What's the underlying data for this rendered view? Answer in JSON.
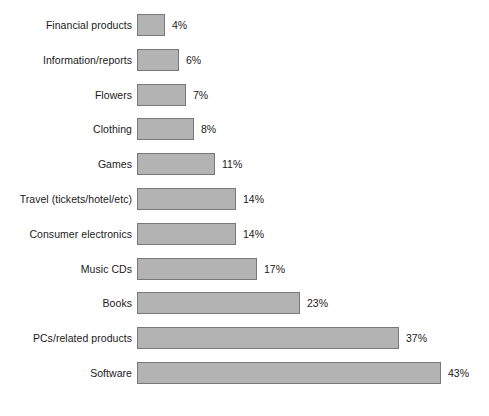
{
  "chart_data": {
    "type": "bar",
    "orientation": "horizontal",
    "title": "",
    "subtitle": "",
    "xlabel": "",
    "ylabel": "",
    "xlim": [
      0,
      43
    ],
    "grid": false,
    "legend": false,
    "value_suffix": "%",
    "categories": [
      "Financial products",
      "Information/reports",
      "Flowers",
      "Clothing",
      "Games",
      "Travel (tickets/hotel/etc)",
      "Consumer electronics",
      "Music CDs",
      "Books",
      "PCs/related products",
      "Software"
    ],
    "values": [
      4,
      6,
      7,
      8,
      11,
      14,
      14,
      17,
      23,
      37,
      43
    ],
    "value_labels": [
      "4%",
      "6%",
      "7%",
      "8%",
      "11%",
      "14%",
      "14%",
      "17%",
      "23%",
      "37%",
      "43%"
    ],
    "bars": [
      {
        "label": "Financial products",
        "value": 4,
        "value_label": "4%"
      },
      {
        "label": "Information/reports",
        "value": 6,
        "value_label": "6%"
      },
      {
        "label": "Flowers",
        "value": 7,
        "value_label": "7%"
      },
      {
        "label": "Clothing",
        "value": 8,
        "value_label": "8%"
      },
      {
        "label": "Games",
        "value": 11,
        "value_label": "11%"
      },
      {
        "label": "Travel (tickets/hotel/etc)",
        "value": 14,
        "value_label": "14%"
      },
      {
        "label": "Consumer electronics",
        "value": 14,
        "value_label": "14%"
      },
      {
        "label": "Music CDs",
        "value": 17,
        "value_label": "17%"
      },
      {
        "label": "Books",
        "value": 23,
        "value_label": "23%"
      },
      {
        "label": "PCs/related products",
        "value": 37,
        "value_label": "37%"
      },
      {
        "label": "Software",
        "value": 43,
        "value_label": "43%"
      }
    ],
    "colors": {
      "bar_fill": "#b3b3b3",
      "bar_border": "#787878",
      "text": "#1a1a1a",
      "background": "#ffffff"
    }
  },
  "layout": {
    "bar_origin_x": 137,
    "label_right_x": 132,
    "px_per_unit": 7.07,
    "bar_height": 22,
    "row_pitch": 34.8,
    "first_row_top": 14,
    "value_gap": 7
  }
}
